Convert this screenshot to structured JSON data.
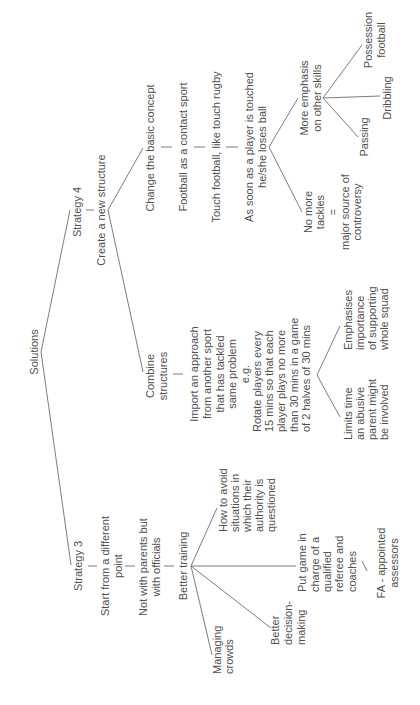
{
  "diagram": {
    "title": "Solutions",
    "orientation": "rotated -90 (read bottom-to-top)",
    "colors": {
      "text": "#505050",
      "lines": "#6e6e6e",
      "background": "#ffffff"
    },
    "root": {
      "label": "Solutions",
      "branches": [
        {
          "label": "Strategy 4",
          "child": {
            "label": "Create a new structure",
            "branches": [
              {
                "label": "Change the basic concept",
                "chain": [
                  "Football as a contact sport",
                  "Touch football, like touch rugby",
                  [
                    "As soon as a player is touched",
                    "he/she loses ball"
                  ]
                ],
                "branches": [
                  {
                    "label": [
                      "More emphasis",
                      "on other skills"
                    ],
                    "branches": [
                      {
                        "label": [
                          "Passing"
                        ]
                      },
                      {
                        "label": [
                          "Dribbling"
                        ]
                      },
                      {
                        "label": [
                          "Possession",
                          "football"
                        ]
                      }
                    ]
                  },
                  {
                    "label": [
                      "No more",
                      "tackles",
                      "=",
                      "major source of",
                      "controversy"
                    ]
                  }
                ]
              },
              {
                "label": [
                  "Combine",
                  "structures"
                ],
                "chain": [
                  [
                    "Import an approach",
                    "from another sport",
                    "that has tackled",
                    "same problem",
                    "e.g."
                  ],
                  [
                    "Rotate players every",
                    "15 mins so that each",
                    "player plays no more",
                    "than 30 mins in a game",
                    "of 2 halves of 30 mins"
                  ]
                ],
                "branches": [
                  {
                    "label": [
                      "Limits time",
                      "an abusive",
                      "parent might",
                      "be involved"
                    ]
                  },
                  {
                    "label": [
                      "Emphasises",
                      "importance",
                      "of supporting",
                      "whole squad"
                    ]
                  }
                ]
              }
            ]
          }
        },
        {
          "label": "Strategy 3",
          "chain": [
            [
              "Start from a different",
              "point"
            ],
            [
              "Not with parents but",
              "with officials"
            ],
            "Better training"
          ],
          "branches": [
            {
              "label": [
                "How to avoid",
                "situations in",
                "which their",
                "authority is",
                "questioned"
              ]
            },
            {
              "label": [
                "Put game in",
                "charge of a",
                "qualified",
                "referee and",
                "coaches"
              ],
              "child": [
                "FA - appointed",
                "assessors"
              ]
            },
            {
              "label": [
                "Better",
                "decision-",
                "making"
              ]
            },
            {
              "label": [
                "Managing",
                "crowds"
              ]
            }
          ]
        }
      ]
    }
  },
  "text": {
    "solutions": "Solutions",
    "s4": "Strategy 4",
    "s4_create": "Create a new structure",
    "s4_change": "Change the basic concept",
    "s4_football_contact": "Football as a contact sport",
    "s4_touch": "Touch football, like touch rugby",
    "s4_assoon_1": "As soon as a player is touched",
    "s4_assoon_2": "he/she loses ball",
    "s4_more_1": "More emphasis",
    "s4_more_2": "on other skills",
    "s4_passing": "Passing",
    "s4_dribbling": "Dribbling",
    "s4_possession_1": "Possession",
    "s4_possession_2": "football",
    "s4_notackle_1": "No more",
    "s4_notackle_2": "tackles",
    "s4_notackle_3": "=",
    "s4_notackle_4": "major source of",
    "s4_notackle_5": "controversy",
    "s4_combine_1": "Combine",
    "s4_combine_2": "structures",
    "s4_import_1": "Import an approach",
    "s4_import_2": "from another sport",
    "s4_import_3": "that has tackled",
    "s4_import_4": "same problem",
    "s4_import_5": "e.g.",
    "s4_rotate_1": "Rotate players every",
    "s4_rotate_2": "15 mins so that each",
    "s4_rotate_3": "player plays no more",
    "s4_rotate_4": "than 30 mins in a game",
    "s4_rotate_5": "of 2 halves of 30 mins",
    "s4_limits_1": "Limits time",
    "s4_limits_2": "an abusive",
    "s4_limits_3": "parent might",
    "s4_limits_4": "be involved",
    "s4_emph_1": "Emphasises",
    "s4_emph_2": "importance",
    "s4_emph_3": "of supporting",
    "s4_emph_4": "whole squad",
    "s3": "Strategy 3",
    "s3_start_1": "Start from a different",
    "s3_start_2": "point",
    "s3_notparents_1": "Not with parents but",
    "s3_notparents_2": "with officials",
    "s3_training": "Better training",
    "s3_avoid_1": "How to avoid",
    "s3_avoid_2": "situations in",
    "s3_avoid_3": "which their",
    "s3_avoid_4": "authority is",
    "s3_avoid_5": "questioned",
    "s3_putgame_1": "Put game in",
    "s3_putgame_2": "charge of a",
    "s3_putgame_3": "qualified",
    "s3_putgame_4": "referee and",
    "s3_putgame_5": "coaches",
    "s3_fa_1": "FA - appointed",
    "s3_fa_2": "assessors",
    "s3_decision_1": "Better",
    "s3_decision_2": "decision-",
    "s3_decision_3": "making",
    "s3_crowds_1": "Managing",
    "s3_crowds_2": "crowds"
  }
}
